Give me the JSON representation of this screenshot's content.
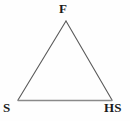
{
  "figure": {
    "type": "triangle-diagram",
    "background_color": "#fefefe",
    "stroke_color": "#5a5a5a",
    "base_stroke_color": "#8a8a8a",
    "label_color": "#1a1a1a",
    "width": 130,
    "height": 121
  },
  "vertices": {
    "apex": {
      "label": "F",
      "x": 66,
      "y": 21
    },
    "bottom_left": {
      "label": "S",
      "x": 18,
      "y": 100
    },
    "bottom_right": {
      "label": "HS",
      "x": 112,
      "y": 100
    }
  },
  "edges": [
    {
      "name": "left-edge",
      "from": "S",
      "to": "F"
    },
    {
      "name": "right-edge",
      "from": "F",
      "to": "HS"
    },
    {
      "name": "base-edge",
      "from": "S",
      "to": "HS"
    }
  ]
}
